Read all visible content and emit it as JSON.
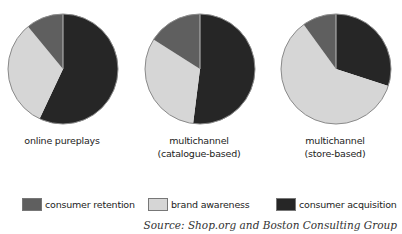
{
  "colors": {
    "consumer_retention": "#5f5f5f",
    "brand_awareness": "#d6d6d6",
    "consumer_acquisition": "#262626",
    "outline": "#8a8a8a",
    "divider": "#bdbdbd"
  },
  "chart_data": {
    "type": "pie",
    "title": "",
    "source": "Source: Shop.org and Boston Consulting Group",
    "legend": [
      "consumer retention",
      "brand awareness",
      "consumer acquisition"
    ],
    "legend_position": "bottom",
    "start_angle": "12 o'clock, clockwise",
    "charts": [
      {
        "label": "online pureplays",
        "slices": [
          {
            "name": "consumer acquisition",
            "value": 57
          },
          {
            "name": "brand awareness",
            "value": 32
          },
          {
            "name": "consumer retention",
            "value": 11
          }
        ]
      },
      {
        "label": "multichannel (catalogue-based)",
        "slices": [
          {
            "name": "consumer acquisition",
            "value": 52
          },
          {
            "name": "brand awareness",
            "value": 32
          },
          {
            "name": "consumer retention",
            "value": 16
          }
        ]
      },
      {
        "label": "multichannel (store-based)",
        "slices": [
          {
            "name": "consumer acquisition",
            "value": 30
          },
          {
            "name": "brand awareness",
            "value": 60
          },
          {
            "name": "consumer retention",
            "value": 10
          }
        ]
      }
    ]
  },
  "labels": {
    "pie1": [
      "online pureplays"
    ],
    "pie2": [
      "multichannel",
      "(catalogue-based)"
    ],
    "pie3": [
      "multichannel",
      "(store-based)"
    ]
  },
  "legend": {
    "items": [
      {
        "label": "consumer retention",
        "key": "consumer_retention"
      },
      {
        "label": "brand awareness",
        "key": "brand_awareness"
      },
      {
        "label": "consumer acquisition",
        "key": "consumer_acquisition"
      }
    ]
  },
  "source": "Source: Shop.org and Boston Consulting Group"
}
